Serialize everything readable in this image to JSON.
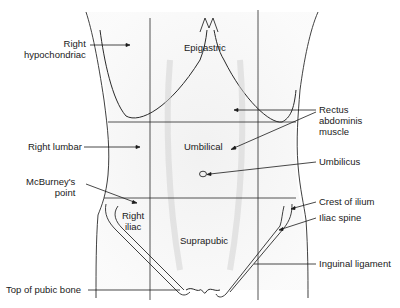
{
  "figure": {
    "region_labels": {
      "right_hypochondriac": [
        "Right",
        "hypochondriac"
      ],
      "epigastric": "Epigastric",
      "right_lumbar": "Right lumbar",
      "umbilical": "Umbilical",
      "right_iliac": [
        "Right",
        "iliac"
      ],
      "suprapubic": "Suprapubic"
    },
    "callouts": {
      "rectus": [
        "Rectus",
        "abdominis",
        "muscle"
      ],
      "umbilicus": "Umbilicus",
      "mcburney": [
        "McBurney's",
        "point"
      ],
      "crest_of_ilium": "Crest of ilium",
      "iliac_spine": "Iliac spine",
      "inguinal_ligament": "Inguinal ligament",
      "top_of_pubic_bone": "Top of pubic bone"
    },
    "grid": {
      "vertical_x": [
        150,
        258
      ],
      "horizontal_y": [
        122,
        198
      ]
    },
    "colors": {
      "line": "#2a2a2a",
      "shading": "#d8d8d8"
    }
  }
}
